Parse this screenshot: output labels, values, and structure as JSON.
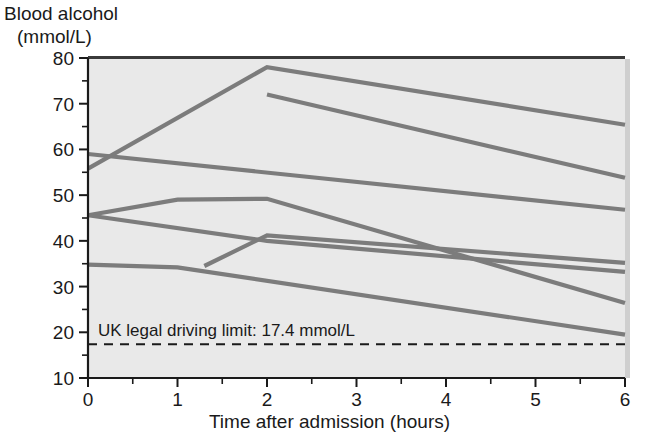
{
  "figure": {
    "y_axis_title_line1": "Blood alcohol",
    "y_axis_title_line2": "(mmol/L)",
    "x_axis_title": "Time after admission (hours)",
    "limit_annotation": "UK legal driving limit: 17.4 mmol/L",
    "colors": {
      "line": "#7c7c7c",
      "plot_background": "#e9e9e9",
      "axis": "#1a1a1a",
      "shadow": "#bdbdbd"
    }
  },
  "chart_data": {
    "type": "line",
    "title": "",
    "subtitle": "",
    "xlabel": "Time after admission (hours)",
    "ylabel": "Blood alcohol (mmol/L)",
    "xlim": [
      0,
      6
    ],
    "ylim": [
      10,
      80
    ],
    "grid": false,
    "legend": "none",
    "x_ticks": [
      0,
      1,
      2,
      3,
      4,
      5,
      6
    ],
    "x_tick_labels": [
      "0",
      "1",
      "2",
      "3",
      "4",
      "5",
      "6"
    ],
    "x_minor_ticks": [
      0.5,
      1.5,
      2.5,
      3.5,
      4.5,
      5.5
    ],
    "y_ticks": [
      10,
      20,
      30,
      40,
      50,
      60,
      70,
      80
    ],
    "y_tick_labels": [
      "10",
      "20",
      "30",
      "40",
      "50",
      "60",
      "70",
      "80"
    ],
    "y_minor_ticks": [
      15,
      25,
      35,
      45,
      55,
      65,
      75
    ],
    "annotations": [
      {
        "text": "UK legal driving limit: 17.4 mmol/L",
        "x": 0.1,
        "y": 19.8,
        "type": "text"
      },
      {
        "text": "",
        "type": "hline",
        "y": 17.4,
        "style": "dashed",
        "x_start": 0,
        "x_end": 6
      }
    ],
    "series": [
      {
        "name": "Patient 1",
        "x": [
          0,
          2,
          6
        ],
        "values": [
          55.8,
          78.0,
          65.4
        ]
      },
      {
        "name": "Patient 2",
        "x": [
          2,
          6
        ],
        "values": [
          72.0,
          53.8
        ]
      },
      {
        "name": "Patient 3",
        "x": [
          0,
          6
        ],
        "values": [
          59.0,
          46.8
        ]
      },
      {
        "name": "Patient 4",
        "x": [
          0,
          1,
          2,
          6
        ],
        "values": [
          45.6,
          49.0,
          49.2,
          26.4
        ]
      },
      {
        "name": "Patient 5",
        "x": [
          0,
          2,
          6
        ],
        "values": [
          45.6,
          40.0,
          33.2
        ]
      },
      {
        "name": "Patient 6",
        "x": [
          0,
          1,
          6
        ],
        "values": [
          34.8,
          34.2,
          19.5
        ]
      },
      {
        "name": "Patient 7",
        "x": [
          1.3,
          2,
          6
        ],
        "values": [
          34.5,
          41.2,
          35.2
        ]
      }
    ]
  }
}
